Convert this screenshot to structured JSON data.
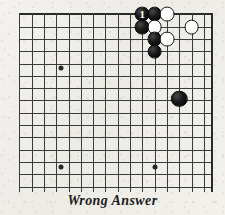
{
  "figure": {
    "caption": "Wrong Answer",
    "board": {
      "type": "go-board-corner",
      "corner": "top-right",
      "line_color": "#3b3b3b",
      "edge_color": "#2a2a2a",
      "background_color": "#f2f0ec",
      "cell_size_px": 12.3,
      "origin_x_px": 19.3,
      "origin_y_px": 14.3,
      "columns": 16,
      "rows": 15,
      "right_edge_x_px": 211,
      "bottom_cut_off": true,
      "star_points": [
        {
          "cx": 60.7,
          "cy": 68.3
        },
        {
          "cx": 60.7,
          "cy": 166.5
        },
        {
          "cx": 154.6,
          "cy": 166.5
        }
      ]
    },
    "stones": [
      {
        "color": "black",
        "cx": 142.3,
        "cy": 14.3,
        "radius": 7.4,
        "label": "1",
        "move_number": 1
      },
      {
        "color": "black",
        "cx": 154.6,
        "cy": 14.3,
        "radius": 7.4,
        "label": ""
      },
      {
        "color": "white",
        "cx": 166.9,
        "cy": 14.3,
        "radius": 7.4,
        "label": ""
      },
      {
        "color": "black",
        "cx": 142.3,
        "cy": 27.0,
        "radius": 7.4,
        "label": ""
      },
      {
        "color": "white",
        "cx": 154.6,
        "cy": 27.0,
        "radius": 7.4,
        "label": ""
      },
      {
        "color": "white",
        "cx": 191.5,
        "cy": 27.0,
        "radius": 7.4,
        "label": ""
      },
      {
        "color": "black",
        "cx": 154.6,
        "cy": 39.3,
        "radius": 7.4,
        "label": ""
      },
      {
        "color": "white",
        "cx": 166.9,
        "cy": 39.3,
        "radius": 7.4,
        "label": ""
      },
      {
        "color": "black",
        "cx": 154.6,
        "cy": 51.6,
        "radius": 7.4,
        "label": ""
      },
      {
        "color": "black",
        "cx": 179.2,
        "cy": 99.0,
        "radius": 8.2,
        "label": ""
      }
    ],
    "grid": {
      "horizontal_y": [
        14.3,
        26.6,
        38.9,
        51.2,
        63.5,
        75.8,
        88.1,
        100.4,
        112.7,
        125.0,
        137.3,
        149.6,
        161.9,
        174.2,
        186.5
      ],
      "vertical_x": [
        19.3,
        31.6,
        43.9,
        56.2,
        68.5,
        80.8,
        93.1,
        105.4,
        117.7,
        130.0,
        142.3,
        154.6,
        166.9,
        179.2,
        191.5,
        203.8,
        211.0
      ]
    }
  }
}
